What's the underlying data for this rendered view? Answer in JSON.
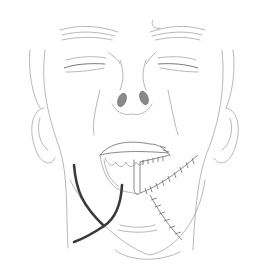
{
  "figure": {
    "colors": {
      "background": "#ffffff",
      "line": "#9a9a9a",
      "marker": "#3a3a3a"
    },
    "elements": [
      "head-outline",
      "eyebrows",
      "closed-eyes",
      "nose",
      "ears",
      "open-mouth-with-teeth",
      "suture-line-horizontal",
      "suture-line-diagonal",
      "thick-marker-lines"
    ]
  }
}
